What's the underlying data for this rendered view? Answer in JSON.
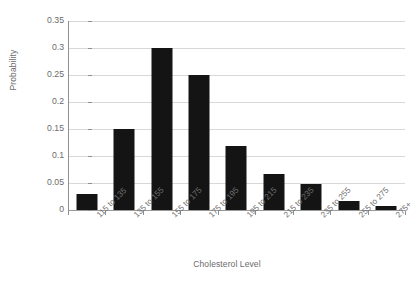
{
  "chart_data": {
    "type": "bar",
    "title": "",
    "xlabel": "Cholesterol Level",
    "ylabel": "Probability",
    "categories": [
      "115 to 135",
      "135 to 155",
      "155 to 175",
      "175 to 195",
      "195 to 215",
      "215 to 235",
      "235 to 255",
      "255 to 275",
      "275+"
    ],
    "values": [
      0.03,
      0.15,
      0.3,
      0.25,
      0.118,
      0.067,
      0.048,
      0.017,
      0.008
    ],
    "ylim": [
      0,
      0.35
    ],
    "ytick_labels": [
      "0",
      "0.05",
      "0.1",
      "0.15",
      "0.2",
      "0.25",
      "0.3",
      "0.35"
    ],
    "ytick_values": [
      0,
      0.05,
      0.1,
      0.15,
      0.2,
      0.25,
      0.3,
      0.35
    ],
    "grid": true,
    "legend": "none",
    "bar_color": "#141414",
    "gridline_color": "#d8d8d8",
    "axis_color": "#8f8f8f",
    "background_color": "#ffffff"
  }
}
